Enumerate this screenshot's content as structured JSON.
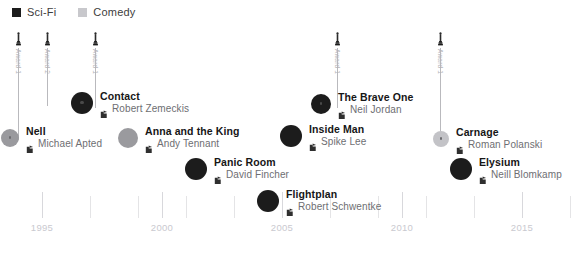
{
  "legend": {
    "items": [
      {
        "label": "Sci-Fi",
        "color": "#1c1c1c",
        "icon": "square-swatch-icon"
      },
      {
        "label": "Comedy",
        "color": "#c8c8cc",
        "icon": "square-swatch-icon"
      }
    ]
  },
  "axis": {
    "years": [
      1995,
      2000,
      2005,
      2010,
      2015
    ],
    "year_labels": [
      "1995",
      "2000",
      "2005",
      "2010",
      "2015"
    ],
    "minor_years": [
      1993,
      1997,
      1999,
      2001,
      2003,
      2007,
      2009,
      2011,
      2013,
      2017
    ],
    "range": [
      1993,
      2017
    ],
    "label_color": "#c9c9cf"
  },
  "awards": [
    {
      "label": "Award 1",
      "year": 1994.0,
      "icon": "oscar-statuette-icon",
      "stem_height": 92
    },
    {
      "label": "Award 2",
      "year": 1995.2,
      "icon": "oscar-statuette-icon",
      "stem_height": 58
    },
    {
      "label": "Award 1",
      "year": 1997.2,
      "icon": "oscar-statuette-icon",
      "stem_height": 60
    },
    {
      "label": "Award 1",
      "year": 2007.3,
      "icon": "oscar-statuette-icon",
      "stem_height": 60
    },
    {
      "label": "Award 1",
      "year": 2011.6,
      "icon": "oscar-statuette-icon",
      "stem_height": 92
    }
  ],
  "films": [
    {
      "title": "Nell",
      "director": "Michael Apted",
      "genre": "Comedy",
      "color": "#9a9a9e",
      "x": 10,
      "y": 134,
      "r": 9,
      "core": true
    },
    {
      "title": "Contact",
      "director": "Robert Zemeckis",
      "genre": "Sci-Fi",
      "color": "#1c1c1c",
      "x": 82,
      "y": 101,
      "r": 11,
      "core": true
    },
    {
      "title": "Anna and the King",
      "director": "Andy Tennant",
      "genre": "Comedy",
      "color": "#9a9a9e",
      "x": 128,
      "y": 135,
      "r": 10,
      "core": false
    },
    {
      "title": "Panic Room",
      "director": "David Fincher",
      "genre": "Sci-Fi",
      "color": "#1c1c1c",
      "x": 196,
      "y": 167,
      "r": 11,
      "core": false
    },
    {
      "title": "Flightplan",
      "director": "Robert Schwentke",
      "genre": "Sci-Fi",
      "color": "#1c1c1c",
      "x": 268,
      "y": 199,
      "r": 11,
      "core": false
    },
    {
      "title": "Inside Man",
      "director": "Spike Lee",
      "genre": "Sci-Fi",
      "color": "#1c1c1c",
      "x": 291,
      "y": 134,
      "r": 11,
      "core": false
    },
    {
      "title": "The Brave One",
      "director": "Neil Jordan",
      "genre": "Sci-Fi",
      "color": "#1c1c1c",
      "x": 321,
      "y": 101,
      "r": 10,
      "core": true
    },
    {
      "title": "Carnage",
      "director": "Roman Polanski",
      "genre": "Comedy",
      "color": "#c3c3c7",
      "x": 441,
      "y": 134,
      "r": 8,
      "core": true
    },
    {
      "title": "Elysium",
      "director": "Neill Blomkamp",
      "genre": "Sci-Fi",
      "color": "#1c1c1c",
      "x": 461,
      "y": 167,
      "r": 11,
      "core": false
    }
  ],
  "icons": {
    "director": "director-chair-icon",
    "award": "oscar-statuette-icon"
  }
}
